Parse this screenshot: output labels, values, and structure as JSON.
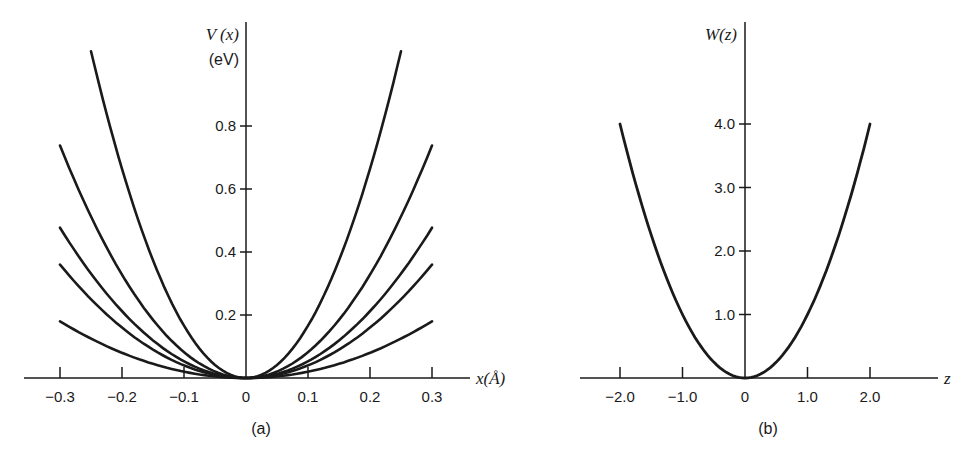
{
  "chart_data": [
    {
      "type": "line",
      "panel": "(a)",
      "title": "",
      "xlabel": "x(Å)",
      "ylabel": "V (x)",
      "yunit": "(eV)",
      "xlim": [
        -0.35,
        0.38
      ],
      "ylim": [
        0,
        1.1
      ],
      "xticks": [
        -0.3,
        -0.2,
        -0.1,
        0,
        0.1,
        0.2,
        0.3
      ],
      "xtick_labels": [
        "−0.3",
        "−0.2",
        "−0.1",
        "0",
        "0.1",
        "0.2",
        "0.3"
      ],
      "yticks": [
        0.2,
        0.4,
        0.6,
        0.8
      ],
      "ytick_labels": [
        "0.2",
        "0.4",
        "0.6",
        "0.8"
      ],
      "grid": false,
      "series": [
        {
          "name": "curve-1",
          "x_range": [
            -0.25,
            0.25
          ],
          "k": 16.6,
          "endpoint_value": 1.04
        },
        {
          "name": "curve-2",
          "x_range": [
            -0.3,
            0.3
          ],
          "k": 8.2,
          "endpoint_value": 0.74
        },
        {
          "name": "curve-3",
          "x_range": [
            -0.3,
            0.3
          ],
          "k": 5.3,
          "endpoint_value": 0.48
        },
        {
          "name": "curve-4",
          "x_range": [
            -0.3,
            0.3
          ],
          "k": 4.0,
          "endpoint_value": 0.36
        },
        {
          "name": "curve-5",
          "x_range": [
            -0.3,
            0.3
          ],
          "k": 2.0,
          "endpoint_value": 0.18
        }
      ],
      "caption": "(a)"
    },
    {
      "type": "line",
      "panel": "(b)",
      "title": "",
      "xlabel": "z",
      "ylabel": "W(z)",
      "xlim": [
        -2.6,
        3.0
      ],
      "ylim": [
        0,
        4.6
      ],
      "xticks": [
        -2.0,
        -1.0,
        0,
        1.0,
        2.0
      ],
      "xtick_labels": [
        "−2.0",
        "−1.0",
        "0",
        "1.0",
        "2.0"
      ],
      "yticks": [
        1.0,
        2.0,
        3.0,
        4.0
      ],
      "ytick_labels": [
        "1.0",
        "2.0",
        "3.0",
        "4.0"
      ],
      "grid": false,
      "series": [
        {
          "name": "W(z) = z^2",
          "x_range": [
            -2.0,
            2.0
          ],
          "k": 1.0,
          "endpoint_value": 4.0
        }
      ],
      "caption": "(b)"
    }
  ],
  "panel_a": {
    "ylabel": "V (x)",
    "yunit": "(eV)",
    "xlabel": "x(Å)",
    "caption": "(a)",
    "xtick_labels": [
      "−0.3",
      "−0.2",
      "−0.1",
      "0",
      "0.1",
      "0.2",
      "0.3"
    ],
    "ytick_labels": [
      "0.2",
      "0.4",
      "0.6",
      "0.8"
    ]
  },
  "panel_b": {
    "ylabel": "W(z)",
    "xlabel": "z",
    "caption": "(b)",
    "xtick_labels": [
      "−2.0",
      "−1.0",
      "0",
      "1.0",
      "2.0"
    ],
    "ytick_labels": [
      "1.0",
      "2.0",
      "3.0",
      "4.0"
    ]
  },
  "colors": {
    "ink": "#1a1a1a",
    "background": "#ffffff"
  }
}
